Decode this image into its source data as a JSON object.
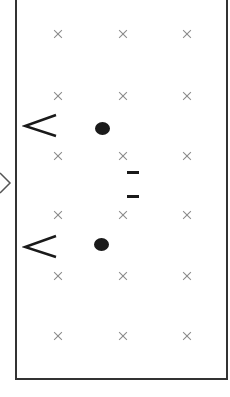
{
  "diagram": {
    "frame": {
      "border_color": "#333333"
    },
    "grid": {
      "cross_color": "#8a8a8a",
      "columns_x": [
        58,
        123,
        187
      ],
      "rows_y": [
        34,
        96,
        156,
        215,
        276,
        336
      ]
    },
    "markers": [
      {
        "type": "chevron-left",
        "x": 24,
        "y": 115
      },
      {
        "type": "dot",
        "x": 95,
        "y": 122
      },
      {
        "type": "dash",
        "x": 127,
        "y": 171
      },
      {
        "type": "dash",
        "x": 127,
        "y": 195
      },
      {
        "type": "chevron-left",
        "x": 24,
        "y": 236
      },
      {
        "type": "dot",
        "x": 94,
        "y": 238
      },
      {
        "type": "chevron-right-partial",
        "x": 0,
        "y": 172
      }
    ]
  }
}
